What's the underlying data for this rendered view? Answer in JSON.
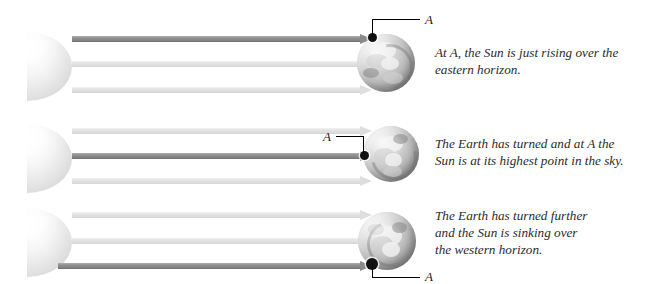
{
  "figure": {
    "width": 666,
    "height": 284,
    "background": "#ffffff"
  },
  "colors": {
    "ray_dark": "#8a8a8a",
    "ray_light": "#dedede",
    "sun_fill": "#f0f0f0",
    "globe_fill": "#bdbdbd",
    "point_a": "#111111",
    "leader_line": "#000000",
    "caption_text": "#2b2b2b"
  },
  "point_label": "A",
  "panels": [
    {
      "id": "panel-1",
      "name": "sunrise",
      "caption": "At A, the Sun is just rising over the eastern horizon.",
      "caption_lines": [
        "At A, the Sun is just rising over the",
        "eastern horizon."
      ],
      "label": "A",
      "label_position": "above-right",
      "point_position": "top-left of globe",
      "rays": [
        {
          "shade": "dark",
          "highlighted": true
        },
        {
          "shade": "light",
          "highlighted": false
        },
        {
          "shade": "light",
          "highlighted": false
        }
      ]
    },
    {
      "id": "panel-2",
      "name": "noon",
      "caption": "The Earth has turned and at A the Sun is at its highest point in the sky.",
      "caption_lines": [
        "The Earth has turned and at A the",
        "Sun is at its highest point in the sky."
      ],
      "label": "A",
      "label_position": "left",
      "point_position": "left edge of globe",
      "rays": [
        {
          "shade": "light",
          "highlighted": false
        },
        {
          "shade": "dark",
          "highlighted": true
        },
        {
          "shade": "light",
          "highlighted": false
        }
      ]
    },
    {
      "id": "panel-3",
      "name": "sunset",
      "caption": "The Earth has turned further and the Sun is sinking over the western horizon.",
      "caption_lines": [
        "The Earth has turned further",
        "and the Sun is sinking over",
        "the western horizon."
      ],
      "label": "A",
      "label_position": "below-right",
      "point_position": "bottom-left of globe",
      "rays": [
        {
          "shade": "light",
          "highlighted": false
        },
        {
          "shade": "light",
          "highlighted": false
        },
        {
          "shade": "dark",
          "highlighted": true
        }
      ]
    }
  ]
}
